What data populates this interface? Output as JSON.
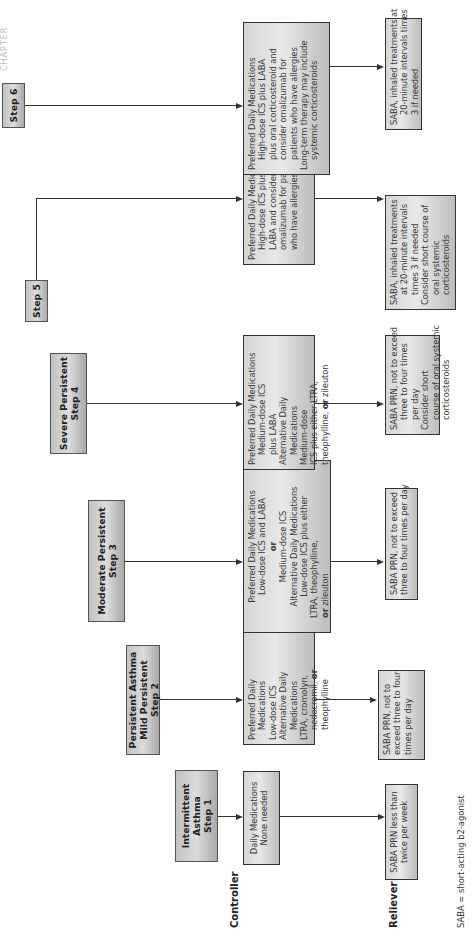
{
  "page_header": "CHAPTER",
  "row_labels": {
    "controller": "Controller",
    "reliever": "Reliever"
  },
  "footnote": "SABA = short-acting b2-agonist",
  "steps": [
    {
      "header": [
        "Intermittent",
        "Asthma",
        "Step 1"
      ],
      "controller": [
        "Daily Medications",
        "None needed"
      ],
      "reliever": [
        "SABA PRN less than",
        "twice per week"
      ]
    },
    {
      "header": [
        "Persistent Asthma",
        "Mild Persistent",
        "Step 2"
      ],
      "controller": [
        "Preferred Daily",
        "Medications",
        "Low-dose ICS",
        "Alternative Daily",
        "Medications",
        "LTRA, cromolyn,",
        "nedocromil,",
        "or",
        "theophylline"
      ],
      "reliever": [
        "SABA PRN, not to",
        "exceed three to four",
        "times per day"
      ]
    },
    {
      "header": [
        "Moderate Persistent",
        "Step 3"
      ],
      "controller": [
        "Preferred Daily Medications",
        "Low-dose ICS and LABA",
        "or",
        "Medium-dose ICS",
        "Alternative Daily Medications",
        "Low-dose ICS plus either",
        "LTRA, theophylline,",
        "or",
        "zileuton"
      ],
      "reliever": [
        "SABA PRN, not to exceed",
        "three to four times per day"
      ]
    },
    {
      "header": [
        "Severe Persistent",
        "Step 4"
      ],
      "controller": [
        "Preferred Daily Medications",
        "Medium-dose ICS",
        "plus LABA",
        "Alternative Daily",
        "Medications",
        "Medium-dose",
        "ICS plus either LTRA,",
        "theophylline,",
        "or",
        "zileuton"
      ],
      "reliever": [
        "SABA PRN, not to exceed",
        "three to four times",
        "per day",
        "Consider short",
        "course of oral systemic",
        "corticosteroids"
      ]
    },
    {
      "header": [
        "Step 5"
      ],
      "controller": [
        "Preferred Daily Medications",
        "High-dose ICS plus",
        "LABA and consider",
        "omalizumab for patients",
        "who have allergies"
      ],
      "reliever": [
        "SABA, inhaled treatments",
        "at 20-minute intervals",
        "times 3 if needed",
        "Consider short course of",
        "oral systemic",
        "corticosteroids"
      ]
    },
    {
      "header": [
        "Step 6"
      ],
      "controller": [
        "Preferred Daily Medications",
        "High-dose ICS plus LABA",
        "plus oral corticosteroid and",
        "consider omalizumab for",
        "patients who have allergies",
        "Long-term therapy may include",
        "systemic corticosteroids"
      ],
      "reliever": [
        "SABA, inhaled treatments at",
        "20-minute intervals times",
        "3 if needed"
      ]
    }
  ]
}
